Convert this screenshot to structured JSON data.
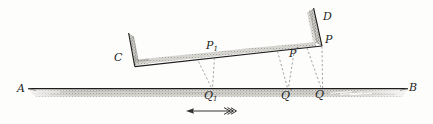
{
  "figure": {
    "style": "engraving",
    "background_color": "#fdfdfc",
    "ink_color": "#1d1d1d",
    "shade_color": "#b9b7b2",
    "dash_color": "#8d8b87",
    "width": 433,
    "height": 124
  },
  "labels": {
    "ground_left": "A",
    "ground_right": "B",
    "trough_left": "C",
    "trough_top_right": "D",
    "point_p1": "P",
    "point_p1_sub": "1",
    "point_p_prime": "P",
    "point_p_prime_sup": "′",
    "point_p": "P",
    "point_q1": "Q",
    "point_q1_sub": "1",
    "point_q_prime": "Q",
    "point_q_prime_sup": "′",
    "point_q": "Q"
  },
  "geometry": {
    "ground_line": {
      "x1": 28,
      "y1": 88.5,
      "x2": 408,
      "y2": 88.5
    },
    "trough_base": {
      "x1": 135,
      "y1": 66.5,
      "x2": 322,
      "y2": 46.0
    },
    "trough_left_wall": {
      "x1": 128.5,
      "y1": 33.0,
      "x2": 135,
      "y2": 66.5
    },
    "trough_right_wall": {
      "x1": 313.5,
      "y1": 8.0,
      "x2": 322,
      "y2": 46.0
    },
    "points_on_trough": [
      {
        "name": "P1",
        "x": 214.0,
        "y": 58.0
      },
      {
        "name": "Pprime",
        "x": 294.0,
        "y": 49.3
      },
      {
        "name": "P",
        "x": 322.0,
        "y": 46.0
      }
    ],
    "points_on_ground": [
      {
        "name": "Q1",
        "x": 212.0,
        "y": 88.5
      },
      {
        "name": "Qprime",
        "x": 288.0,
        "y": 88.5
      },
      {
        "name": "Q",
        "x": 322.0,
        "y": 88.5
      }
    ],
    "dashed_projection_lines": [
      {
        "from_x": 198.0,
        "from_y": 62.0,
        "to_x": 212.0,
        "to_y": 88.0
      },
      {
        "from_x": 214.0,
        "from_y": 58.5,
        "to_x": 212.0,
        "to_y": 88.0
      },
      {
        "from_x": 277.0,
        "from_y": 51.5,
        "to_x": 288.0,
        "to_y": 88.0
      },
      {
        "from_x": 294.0,
        "from_y": 49.5,
        "to_x": 288.0,
        "to_y": 88.0
      },
      {
        "from_x": 307.0,
        "from_y": 48.0,
        "to_x": 322.0,
        "to_y": 88.0
      },
      {
        "from_x": 322.0,
        "from_y": 46.5,
        "to_x": 322.0,
        "to_y": 88.0
      }
    ],
    "motion_arrow": {
      "tail_x": 233.0,
      "tip_x": 186.0,
      "y": 111.0,
      "direction": "left",
      "fletching": true
    }
  },
  "label_positions": {
    "A": {
      "x": 17,
      "y": 84
    },
    "B": {
      "x": 410,
      "y": 83
    },
    "C": {
      "x": 115,
      "y": 53
    },
    "D": {
      "x": 324,
      "y": 11
    },
    "P1": {
      "x": 206,
      "y": 41
    },
    "Pprime": {
      "x": 290,
      "y": 48
    },
    "P": {
      "x": 326,
      "y": 35
    },
    "Q1": {
      "x": 205,
      "y": 91
    },
    "Qprime": {
      "x": 282,
      "y": 90
    },
    "Q": {
      "x": 316,
      "y": 90
    }
  }
}
